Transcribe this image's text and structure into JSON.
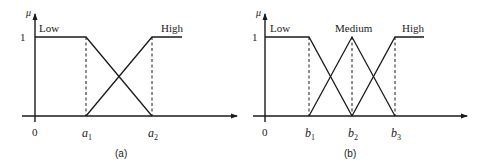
{
  "figure": {
    "panels": [
      {
        "id": "a",
        "caption": "(a)",
        "y_axis_label": "μ",
        "y_tick_label": "1",
        "origin_label": "0",
        "x_ticks": [
          {
            "base": "a",
            "sub": "1"
          },
          {
            "base": "a",
            "sub": "2"
          }
        ],
        "sets": [
          {
            "name": "Low",
            "shape": "z-shaped",
            "points": [
              [
                0,
                1
              ],
              [
                "a1",
                1
              ],
              [
                "a2",
                0
              ]
            ]
          },
          {
            "name": "High",
            "shape": "s-shaped",
            "points": [
              [
                "a1",
                0
              ],
              [
                "a2",
                1
              ],
              [
                "end",
                1
              ]
            ]
          }
        ]
      },
      {
        "id": "b",
        "caption": "(b)",
        "y_axis_label": "μ",
        "y_tick_label": "1",
        "origin_label": "0",
        "x_ticks": [
          {
            "base": "b",
            "sub": "1"
          },
          {
            "base": "b",
            "sub": "2"
          },
          {
            "base": "b",
            "sub": "3"
          }
        ],
        "sets": [
          {
            "name": "Low",
            "shape": "z-shaped",
            "points": [
              [
                0,
                1
              ],
              [
                "b1",
                1
              ],
              [
                "b2",
                0
              ]
            ]
          },
          {
            "name": "Medium",
            "shape": "triangular",
            "points": [
              [
                "b1",
                0
              ],
              [
                "b2",
                1
              ],
              [
                "b3",
                0
              ]
            ]
          },
          {
            "name": "High",
            "shape": "s-shaped",
            "points": [
              [
                "b2",
                0
              ],
              [
                "b3",
                1
              ],
              [
                "end",
                1
              ]
            ]
          }
        ]
      }
    ]
  },
  "colors": {
    "line": "#1a1a1a",
    "background": "#ffffff"
  }
}
